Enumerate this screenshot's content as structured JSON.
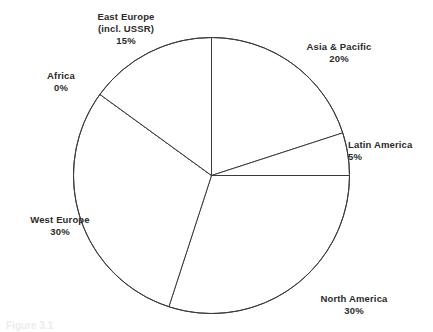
{
  "figure": {
    "background_color": "#ffffff",
    "line_color": "#3a3a3a",
    "text_color": "#2b2b2b",
    "caption": "Figure 3.1"
  },
  "chart_data": {
    "type": "pie",
    "title": "",
    "xlabel": "",
    "ylabel": "",
    "legend_position": "outside-labels",
    "grid": false,
    "start_angle_deg": 90,
    "direction": "clockwise",
    "categories": [
      "Asia & Pacific",
      "Latin America",
      "North America",
      "West Europe",
      "Africa",
      "East Europe (incl. USSR)"
    ],
    "values": [
      20,
      5,
      30,
      30,
      0,
      15
    ],
    "labels": [
      {
        "name": "Asia & Pacific",
        "value": "20%"
      },
      {
        "name": "Latin America",
        "value": "5%"
      },
      {
        "name": "North America",
        "value": "30%"
      },
      {
        "name": "West Europe",
        "value": "30%"
      },
      {
        "name": "Africa",
        "value": "0%"
      },
      {
        "name": "East Europe",
        "name2": "(incl. USSR)",
        "value": "15%"
      }
    ],
    "slices": [
      {
        "id": "asia-pacific",
        "label": "Asia & Pacific",
        "percent": 20,
        "color": "#ffffff"
      },
      {
        "id": "latin-america",
        "label": "Latin America",
        "percent": 5,
        "color": "#ffffff"
      },
      {
        "id": "north-america",
        "label": "North America",
        "percent": 30,
        "color": "#ffffff"
      },
      {
        "id": "west-europe",
        "label": "West Europe",
        "percent": 30,
        "color": "#ffffff"
      },
      {
        "id": "africa",
        "label": "Africa",
        "percent": 0,
        "color": "#ffffff"
      },
      {
        "id": "east-europe",
        "label": "East Europe (incl. USSR)",
        "percent": 15,
        "color": "#ffffff"
      }
    ],
    "geometry": {
      "center_x": 211.5,
      "center_y": 175.5,
      "radius": 138
    }
  }
}
